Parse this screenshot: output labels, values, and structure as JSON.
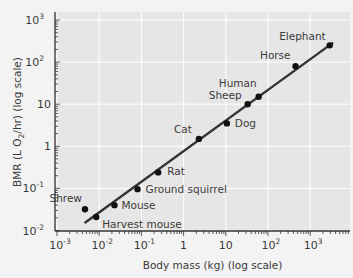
{
  "chart_data": {
    "type": "scatter",
    "title": "",
    "xlabel": "Body mass (kg) (log scale)",
    "ylabel": "BMR (L O2/hr) (log scale)",
    "xscale": "log",
    "yscale": "log",
    "xlim": [
      0.001,
      10000
    ],
    "ylim": [
      0.01,
      1000
    ],
    "x_ticks": [
      "10^-3",
      "10^-2",
      "10^-1",
      "1",
      "10",
      "10^2",
      "10^3"
    ],
    "y_ticks": [
      "10^-2",
      "10^-1",
      "1",
      "10",
      "10^2",
      "10^3"
    ],
    "grid": true,
    "legend": null,
    "points": [
      {
        "label": "Shrew",
        "x": 0.0046,
        "y": 0.032
      },
      {
        "label": "Harvest mouse",
        "x": 0.0085,
        "y": 0.021
      },
      {
        "label": "Mouse",
        "x": 0.023,
        "y": 0.04
      },
      {
        "label": "Ground squirrel",
        "x": 0.081,
        "y": 0.096
      },
      {
        "label": "Rat",
        "x": 0.25,
        "y": 0.24
      },
      {
        "label": "Cat",
        "x": 2.3,
        "y": 1.5
      },
      {
        "label": "Dog",
        "x": 10.6,
        "y": 3.5
      },
      {
        "label": "Sheep",
        "x": 33,
        "y": 10
      },
      {
        "label": "Human",
        "x": 60,
        "y": 15
      },
      {
        "label": "Horse",
        "x": 450,
        "y": 80
      },
      {
        "label": "Elephant",
        "x": 2900,
        "y": 250
      }
    ],
    "fit_line": {
      "x_start": 0.0045,
      "y_start": 0.015,
      "x_end": 3500,
      "y_end": 290
    }
  },
  "labels": {
    "xlabel": "Body mass (kg) (log scale)",
    "ylabel_pre": "BMR (L O",
    "ylabel_sub": "2",
    "ylabel_post": "/hr) (log scale)",
    "x_tick_base": "10",
    "x_ticks": [
      {
        "base": "10",
        "exp": "-3"
      },
      {
        "base": "10",
        "exp": "-2"
      },
      {
        "base": "10",
        "exp": "-1"
      },
      {
        "base": "1",
        "exp": ""
      },
      {
        "base": "10",
        "exp": ""
      },
      {
        "base": "10",
        "exp": "2"
      },
      {
        "base": "10",
        "exp": "3"
      }
    ],
    "y_ticks": [
      {
        "base": "10",
        "exp": "3"
      },
      {
        "base": "10",
        "exp": "2"
      },
      {
        "base": "10",
        "exp": ""
      },
      {
        "base": "1",
        "exp": ""
      },
      {
        "base": "10",
        "exp": "-1"
      },
      {
        "base": "10",
        "exp": "-2"
      }
    ]
  },
  "colors": {
    "background": "#f3f3f3",
    "plot_bg": "#e6e6e6",
    "grid": "#ffffff",
    "axis": "#333333",
    "line": "#333333",
    "point": "#111111"
  }
}
